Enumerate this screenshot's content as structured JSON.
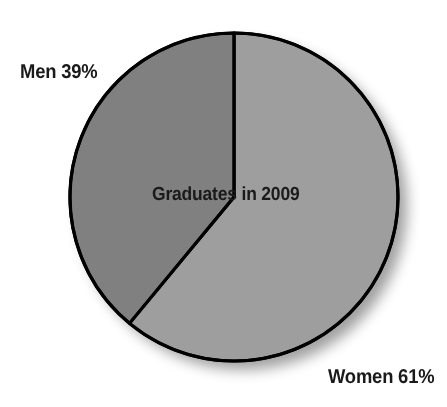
{
  "figure": {
    "name": "graduates-2009-pie-chart",
    "background_color": "#ffffff",
    "outline_color": "#000000"
  },
  "labels": {
    "men": "Men 39%",
    "women": "Women 61%",
    "center": "Graduates in 2009"
  },
  "chart_data": {
    "type": "pie",
    "title": "Graduates in 2009",
    "xlabel": "",
    "ylabel": "",
    "grid": false,
    "legend": "none",
    "value_unit": "percent",
    "center_label": "Graduates in 2009",
    "start_angle_deg": 0,
    "direction": "clockwise",
    "categories": [
      "Women",
      "Men"
    ],
    "values": [
      61,
      39
    ],
    "labels": [
      "Women 61%",
      "Men 39%"
    ],
    "colors": [
      "#9e9e9e",
      "#808080"
    ],
    "slices": [
      {
        "name": "Women",
        "value": 61,
        "label": "Women 61%",
        "color": "#9e9e9e",
        "angle_deg": 219.6,
        "label_position": "bottom-right"
      },
      {
        "name": "Men",
        "value": 39,
        "label": "Men 39%",
        "color": "#808080",
        "angle_deg": 140.4,
        "label_position": "top-left"
      }
    ]
  }
}
